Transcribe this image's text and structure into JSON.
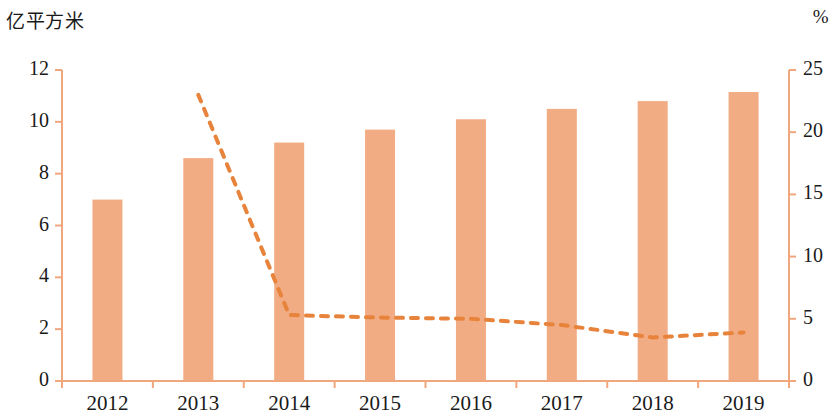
{
  "chart_data": {
    "type": "bar",
    "title": "",
    "subtitle": "",
    "xlabel": "",
    "ylabel": "亿平方米",
    "y2label": "%",
    "categories": [
      "2012",
      "2013",
      "2014",
      "2015",
      "2016",
      "2017",
      "2018",
      "2019"
    ],
    "series": [
      {
        "name": "亿平方米",
        "type": "bar",
        "axis": "left",
        "values": [
          7.0,
          8.6,
          9.2,
          9.7,
          10.1,
          10.5,
          10.8,
          11.15
        ],
        "color": "#F2AC84"
      },
      {
        "name": "%",
        "type": "line",
        "style": "dashed",
        "axis": "right",
        "values": [
          null,
          23.0,
          5.3,
          5.1,
          5.0,
          4.5,
          3.5,
          3.9
        ],
        "color": "#E8833C"
      }
    ],
    "ylim": [
      0,
      12
    ],
    "yticks": [
      "0",
      "2",
      "4",
      "6",
      "8",
      "10",
      "12"
    ],
    "y2lim": [
      0,
      25
    ],
    "y2ticks": [
      "0",
      "5",
      "10",
      "15",
      "20",
      "25"
    ],
    "grid": false,
    "legend": null,
    "axis_color": "#F0A77E",
    "text_color": "#1a1a1a"
  }
}
